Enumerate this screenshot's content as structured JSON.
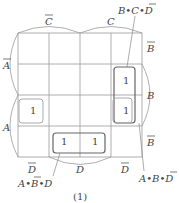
{
  "diagram": {
    "type": "karnaugh-map",
    "caption": "(1)",
    "top_labels": {
      "left": "C",
      "left_bar": true,
      "right": "C",
      "right_bar": false
    },
    "left_labels": {
      "top": "A",
      "top_bar": true,
      "bottom": "A",
      "bottom_bar": false
    },
    "right_labels": [
      {
        "text": "B",
        "bar": true
      },
      {
        "text": "B",
        "bar": false
      },
      {
        "text": "B",
        "bar": true
      }
    ],
    "bottom_labels": [
      {
        "text": "D",
        "bar": true
      },
      {
        "text": "D",
        "bar": false
      },
      {
        "text": "D",
        "bar": true
      }
    ],
    "cells": [
      [
        "",
        "",
        "",
        ""
      ],
      [
        "",
        "",
        "",
        "1"
      ],
      [
        "1",
        "",
        "",
        "1"
      ],
      [
        "",
        "1",
        "1",
        ""
      ]
    ],
    "groups": [
      {
        "name": "B·C·D̄",
        "label_parts": [
          "B",
          "•",
          "C",
          "•",
          "D"
        ],
        "bar_on": [
          4
        ]
      },
      {
        "name": "A·B·D̄",
        "label_parts": [
          "A",
          "•",
          "B",
          "•",
          "D"
        ],
        "bar_on": [
          4
        ]
      },
      {
        "name": "A·B̄·D",
        "label_parts": [
          "A",
          "•",
          "B",
          "•",
          "D"
        ],
        "bar_on": [
          2
        ]
      }
    ]
  }
}
